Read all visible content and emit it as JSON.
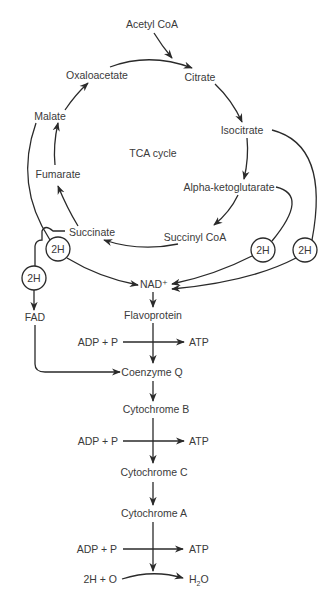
{
  "diagram": {
    "title": "TCA cycle",
    "tca_cycle": {
      "input": "Acetyl CoA",
      "intermediates": [
        "Citrate",
        "Isocitrate",
        "Alpha-ketoglutarate",
        "Succinyl CoA",
        "Succinate",
        "Fumarate",
        "Malate",
        "Oxaloacetate"
      ],
      "center_label": "TCA cycle"
    },
    "hydrogen_carriers": {
      "h2_label": "2H",
      "nad": "NAD⁺",
      "fad": "FAD"
    },
    "electron_transport_chain": {
      "steps": [
        "Flavoprotein",
        "Coenzyme Q",
        "Cytochrome B",
        "Cytochrome C",
        "Cytochrome A"
      ],
      "phosphorylation": {
        "input": "ADP + P",
        "output": "ATP"
      },
      "final": {
        "input": "2H + O",
        "output_base": "H",
        "output_sub": "2",
        "output_tail": "O"
      }
    }
  }
}
